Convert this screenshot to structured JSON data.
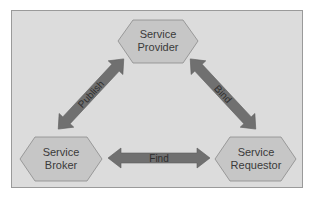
{
  "diagram": {
    "type": "SOA triangle",
    "colors": {
      "background": "#dcdcdc",
      "frame_border": "#9a9a9a",
      "node_fill": "#c6c6c6",
      "node_stroke": "#8a8a8a",
      "arrow_fill": "#707070",
      "text": "#3a3a3a"
    },
    "nodes": [
      {
        "id": "provider",
        "line1": "Service",
        "line2": "Provider"
      },
      {
        "id": "broker",
        "line1": "Service",
        "line2": "Broker"
      },
      {
        "id": "requestor",
        "line1": "Service",
        "line2": "Requestor"
      }
    ],
    "edges": [
      {
        "from": "provider",
        "to": "broker",
        "label": "Publish",
        "direction": "bidirectional"
      },
      {
        "from": "provider",
        "to": "requestor",
        "label": "Bind",
        "direction": "bidirectional"
      },
      {
        "from": "broker",
        "to": "requestor",
        "label": "Find",
        "direction": "bidirectional"
      }
    ]
  }
}
